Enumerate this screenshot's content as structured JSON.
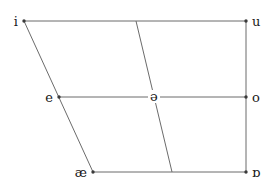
{
  "chart_data": {
    "type": "scatter",
    "title": "",
    "subtitle": "",
    "xlabel": "",
    "ylabel": "",
    "grid": false,
    "legend": false,
    "xlim": [
      0,
      273
    ],
    "ylim": [
      187,
      0
    ],
    "categories": [
      "i",
      "u",
      "e",
      "ə",
      "o",
      "æ",
      "ɒ"
    ],
    "points": [
      {
        "label": "i",
        "name": "close-front-unrounded",
        "x": 24,
        "y": 21,
        "label_side": "left"
      },
      {
        "label": "u",
        "name": "close-back-rounded",
        "x": 246,
        "y": 21,
        "label_side": "right"
      },
      {
        "label": "e",
        "name": "mid-front-unrounded",
        "x": 59,
        "y": 97,
        "label_side": "left"
      },
      {
        "label": "ə",
        "name": "mid-central-schwa",
        "x": 152,
        "y": 97,
        "label_side": "center"
      },
      {
        "label": "o",
        "name": "mid-back-rounded",
        "x": 246,
        "y": 97,
        "label_side": "right"
      },
      {
        "label": "æ",
        "name": "open-front-unrounded",
        "x": 93,
        "y": 172,
        "label_side": "left"
      },
      {
        "label": "ɒ",
        "name": "open-back-rounded",
        "x": 246,
        "y": 172,
        "label_side": "right"
      }
    ],
    "lines": [
      {
        "name": "top-edge",
        "x1": 24,
        "y1": 21,
        "x2": 246,
        "y2": 21
      },
      {
        "name": "left-edge",
        "x1": 24,
        "y1": 21,
        "x2": 93,
        "y2": 172
      },
      {
        "name": "right-edge",
        "x1": 246,
        "y1": 21,
        "x2": 246,
        "y2": 172
      },
      {
        "name": "bottom-edge",
        "x1": 93,
        "y1": 172,
        "x2": 246,
        "y2": 172
      },
      {
        "name": "mid-horizontal",
        "x1": 59,
        "y1": 97,
        "x2": 246,
        "y2": 97
      },
      {
        "name": "central-diagonal",
        "x1": 136,
        "y1": 21,
        "x2": 172,
        "y2": 172
      }
    ],
    "colors": {
      "line": "#6b6b6b",
      "dot": "#3a3a3a",
      "label": "#1a1a1a",
      "background": "#ffffff"
    }
  }
}
